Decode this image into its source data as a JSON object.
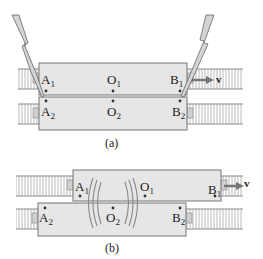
{
  "colors": {
    "car_fill": "#e6e6e6",
    "car_stroke": "#777777",
    "track": "#9a9a9a",
    "bolt_fill": "#d4d4d4",
    "bolt_stroke": "#666666",
    "arrow": "#777777",
    "waves": "#888888",
    "dot": "#333333"
  },
  "figure_a": {
    "caption": "(a)",
    "top_car": {
      "points": [
        {
          "letter": "A",
          "sub": "1"
        },
        {
          "letter": "O",
          "sub": "1"
        },
        {
          "letter": "B",
          "sub": "1"
        }
      ]
    },
    "bottom_car": {
      "points": [
        {
          "letter": "A",
          "sub": "2"
        },
        {
          "letter": "O",
          "sub": "2"
        },
        {
          "letter": "B",
          "sub": "2"
        }
      ]
    },
    "velocity_label": "v"
  },
  "figure_b": {
    "caption": "(b)",
    "top_car": {
      "points": [
        {
          "letter": "A",
          "sub": "1"
        },
        {
          "letter": "O",
          "sub": "1"
        },
        {
          "letter": "B",
          "sub": "1"
        }
      ]
    },
    "bottom_car": {
      "points": [
        {
          "letter": "A",
          "sub": "2"
        },
        {
          "letter": "O",
          "sub": "2"
        },
        {
          "letter": "B",
          "sub": "2"
        }
      ]
    },
    "velocity_label": "v"
  }
}
